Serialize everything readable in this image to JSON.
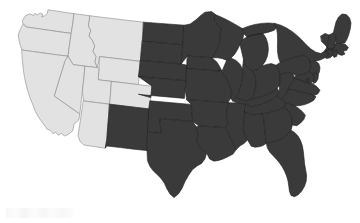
{
  "figure": {
    "title": "Map of the contiguous United States",
    "type": "choropleth-map",
    "background_color": "#ffffff"
  },
  "style": {
    "light_fill": "#e2e2e2",
    "dark_fill": "#3a3a3a",
    "light_border": "#8a8a8a",
    "dark_border": "#1f1f1f",
    "border_width": 0.6
  },
  "legend": {
    "visible": false,
    "categories": [
      {
        "key": "light",
        "label": "Western group",
        "color": "#e2e2e2"
      },
      {
        "key": "dark",
        "label": "Remaining states",
        "color": "#3a3a3a"
      }
    ]
  },
  "map_data": {
    "type": "choropleth",
    "region": "contiguous-united-states",
    "projection": "albers-usa",
    "group_counts": {
      "light": 10,
      "dark": 39
    },
    "light_states": [
      "WA",
      "OR",
      "ID",
      "MT",
      "WY",
      "NV",
      "UT",
      "CO",
      "CA",
      "AZ"
    ],
    "dark_states": [
      "ND",
      "SD",
      "NE",
      "KS",
      "OK",
      "TX",
      "NM",
      "MN",
      "IA",
      "MO",
      "AR",
      "LA",
      "WI",
      "IL",
      "MS",
      "MI",
      "IN",
      "KY",
      "TN",
      "AL",
      "OH",
      "WV",
      "GA",
      "FL",
      "SC",
      "NC",
      "VA",
      "PA",
      "NY",
      "MD",
      "DE",
      "NJ",
      "CT",
      "RI",
      "MA",
      "VT",
      "NH",
      "ME",
      "DC"
    ],
    "states": [
      {
        "code": "WA",
        "name": "Washington",
        "group": "light",
        "path": "M22.5 20.3 L25.8 15.2 L30.4 13.9 L33.6 15.6 L35.0 13.2 L36.8 15.1 L40.2 13.0 L43.0 14.4 L41.6 16.8 L44.5 15.9 L47.2 13.6 L48.0 9.8 L52.0 10.4 L58.8 11.4 L66.4 12.6 L74.2 13.7 L72.6 24.6 L71.2 33.4 L60.0 31.9 L48.6 30.2 L37.4 28.6 L26.2 27.0 L23.4 24.0 Z"
      },
      {
        "code": "OR",
        "name": "Oregon",
        "group": "light",
        "path": "M23.4 24.0 L26.2 27.0 L37.4 28.6 L48.6 30.2 L60.0 31.9 L71.2 33.4 L69.4 45.6 L68.0 56.2 L56.6 54.8 L45.0 53.2 L33.4 51.6 L22.0 50.0 L19.6 43.2 L18.2 35.0 L20.4 29.2 Z"
      },
      {
        "code": "ID",
        "name": "Idaho",
        "group": "light",
        "path": "M74.2 13.7 L82.0 14.7 L90.2 15.8 L88.6 26.0 L90.8 30.4 L89.0 36.0 L92.4 40.2 L94.8 46.0 L93.0 51.4 L96.2 56.4 L95.0 62.0 L97.4 67.6 L85.2 66.2 L73.0 64.6 L68.0 56.2 L69.4 45.6 L71.2 33.4 L72.6 24.6 Z"
      },
      {
        "code": "MT",
        "name": "Montana",
        "group": "light",
        "path": "M90.2 15.8 L103.0 17.4 L116.4 19.0 L130.0 20.6 L143.6 22.2 L142.4 36.6 L141.2 51.0 L140.4 61.4 L127.0 59.8 L113.4 58.2 L99.8 56.6 L97.4 67.6 L95.0 62.0 L96.2 56.4 L93.0 51.4 L94.8 46.0 L92.4 40.2 L89.0 36.0 L90.8 30.4 L88.6 26.0 Z"
      },
      {
        "code": "WY",
        "name": "Wyoming",
        "group": "light",
        "path": "M99.8 56.6 L113.4 58.2 L127.0 59.8 L140.4 61.4 L139.4 73.0 L138.4 84.6 L125.0 83.0 L111.6 81.4 L98.2 79.8 L99.0 68.2 Z"
      },
      {
        "code": "NV",
        "name": "Nevada",
        "group": "light",
        "path": "M68.0 56.2 L73.0 64.6 L85.2 66.2 L83.8 78.6 L82.4 91.0 L81.0 103.4 L79.8 114.0 L70.0 107.2 L62.0 101.6 L54.2 96.0 L58.4 82.0 L62.0 70.4 L64.8 61.2 Z"
      },
      {
        "code": "UT",
        "name": "Utah",
        "group": "light",
        "path": "M85.2 66.2 L97.4 67.6 L99.0 68.2 L98.2 79.8 L111.6 81.4 L110.6 92.8 L109.6 104.2 L96.6 102.6 L83.6 101.0 L82.4 91.0 L83.8 78.6 Z"
      },
      {
        "code": "CO",
        "name": "Colorado",
        "group": "light",
        "path": "M111.6 81.4 L125.0 83.0 L138.4 84.6 L151.8 86.2 L150.8 97.6 L149.8 109.0 L136.4 107.4 L123.0 105.8 L109.6 104.2 L110.6 92.8 Z"
      },
      {
        "code": "CA",
        "name": "California",
        "group": "light",
        "path": "M22.0 50.0 L33.4 51.6 L45.0 53.2 L56.6 54.8 L68.0 56.2 L64.8 61.2 L62.0 70.4 L58.4 82.0 L54.2 96.0 L62.0 101.6 L70.0 107.2 L79.8 114.0 L78.8 120.0 L74.0 124.2 L72.8 130.6 L68.4 134.4 L64.6 136.0 L61.0 133.2 L58.8 135.4 L55.2 132.0 L53.0 133.8 L50.4 130.4 L47.0 129.0 L44.8 125.8 L42.0 122.0 L38.6 117.2 L35.4 111.6 L33.0 105.0 L30.2 98.4 L27.8 91.0 L25.8 83.4 L24.2 75.6 L23.0 67.2 L22.2 58.6 Z"
      },
      {
        "code": "AZ",
        "name": "Arizona",
        "group": "light",
        "path": "M83.6 101.0 L96.6 102.6 L109.6 104.2 L108.6 115.8 L107.6 127.4 L106.8 139.0 L105.2 148.2 L93.0 146.4 L84.0 145.0 L80.2 141.6 L78.0 135.8 L79.2 128.0 L80.6 119.0 L81.8 110.4 Z"
      },
      {
        "code": "NM",
        "name": "New Mexico",
        "group": "dark",
        "path": "M109.6 104.2 L123.0 105.8 L136.4 107.4 L149.8 109.0 L148.8 120.6 L147.8 132.2 L146.8 143.8 L147.0 150.6 L133.8 149.2 L120.4 147.6 L107.0 146.0 L105.2 148.2 L106.8 139.0 L107.6 127.4 L108.6 115.8 Z"
      },
      {
        "code": "ND",
        "name": "North Dakota",
        "group": "dark",
        "path": "M143.6 22.2 L157.2 23.2 L170.8 24.2 L184.4 25.2 L183.6 35.0 L182.8 44.8 L169.4 43.6 L156.0 42.4 L142.4 41.2 L143.0 31.6 Z"
      },
      {
        "code": "SD",
        "name": "South Dakota",
        "group": "dark",
        "path": "M142.4 41.2 L156.0 42.4 L169.4 43.6 L182.8 44.8 L182.0 54.4 L181.2 64.0 L167.6 62.8 L154.0 61.6 L140.4 60.4 L141.2 51.0 Z"
      },
      {
        "code": "NE",
        "name": "Nebraska",
        "group": "dark",
        "path": "M140.4 60.4 L154.0 61.6 L167.6 62.8 L181.2 64.0 L187.4 65.2 L186.8 72.0 L186.0 80.8 L172.2 79.6 L158.4 78.4 L144.8 77.2 L138.4 76.4 L139.4 68.4 Z"
      },
      {
        "code": "KS",
        "name": "Kansas",
        "group": "dark",
        "path": "M138.4 76.4 L144.8 77.2 L158.4 78.4 L172.2 79.6 L186.0 80.8 L185.2 89.6 L184.4 98.4 L170.6 97.2 L156.8 96.0 L143.0 94.8 L138.4 94.2 L150.8 97.6 L151.8 86.2 Z"
      },
      {
        "code": "OK",
        "name": "Oklahoma",
        "group": "dark",
        "path": "M147.8 132.2 L161.2 133.4 L160.4 126.0 L159.8 118.6 L173.2 119.8 L186.6 121.0 L192.8 121.6 L192.0 113.0 L191.2 104.4 L177.4 103.2 L163.6 102.0 L149.8 100.8 L148.8 108.4 Z"
      },
      {
        "code": "TX",
        "name": "Texas",
        "group": "dark",
        "path": "M147.0 150.6 L146.8 143.8 L147.8 132.2 L161.2 133.4 L160.4 126.0 L159.8 118.6 L173.2 119.8 L186.6 121.0 L192.8 121.6 L196.4 127.0 L198.0 134.0 L196.6 141.0 L199.4 146.4 L202.8 150.2 L206.6 153.0 L205.0 158.8 L201.6 163.4 L197.0 166.0 L192.4 169.8 L188.6 175.2 L185.0 181.6 L182.0 188.4 L178.4 194.0 L174.0 197.6 L170.2 194.2 L167.0 189.0 L164.4 183.2 L161.0 178.4 L157.2 174.6 L153.4 171.0 L150.0 166.6 L147.6 161.0 Z"
      },
      {
        "code": "MN",
        "name": "Minnesota",
        "group": "dark",
        "path": "M184.4 25.2 L190.2 24.0 L196.0 19.8 L200.8 15.4 L205.0 12.2 L211.6 11.6 L215.8 14.8 L214.4 20.4 L217.6 25.0 L221.4 28.2 L219.8 33.8 L220.6 40.0 L218.2 46.8 L215.4 52.4 L212.0 57.8 L198.6 56.8 L187.4 56.0 L181.2 64.0 L182.0 54.4 L182.8 44.8 L183.6 35.0 Z"
      },
      {
        "code": "IA",
        "name": "Iowa",
        "group": "dark",
        "path": "M187.4 56.0 L198.6 56.8 L212.0 57.8 L216.8 62.0 L219.6 66.4 L222.0 71.2 L208.4 70.2 L194.8 69.2 L186.8 68.4 L186.8 62.0 Z"
      },
      {
        "code": "MO",
        "name": "Missouri",
        "group": "dark",
        "path": "M186.8 68.4 L194.8 69.2 L208.4 70.2 L222.0 71.2 L225.2 76.0 L227.8 81.4 L230.0 87.0 L232.4 92.6 L230.6 98.2 L228.0 102.6 L214.2 101.6 L200.4 100.6 L186.6 99.6 L185.2 89.6 L186.0 80.8 Z"
      },
      {
        "code": "AR",
        "name": "Arkansas",
        "group": "dark",
        "path": "M186.6 99.6 L200.4 100.6 L214.2 101.6 L228.0 102.6 L227.2 110.2 L226.4 117.8 L228.4 123.0 L226.0 127.8 L212.4 126.8 L198.8 125.8 L192.8 121.6 L192.0 113.0 L191.2 104.4 Z"
      },
      {
        "code": "LA",
        "name": "Louisiana",
        "group": "dark",
        "path": "M198.8 125.8 L212.4 126.8 L226.0 127.8 L228.8 133.2 L231.0 139.0 L233.6 144.4 L236.2 149.6 L233.0 154.0 L228.4 156.6 L223.6 158.8 L218.8 160.4 L214.0 161.2 L209.6 159.0 L206.6 153.0 L202.8 150.2 L199.4 146.4 L196.6 141.0 L198.0 134.0 L196.4 127.0 Z"
      },
      {
        "code": "WI",
        "name": "Wisconsin",
        "group": "dark",
        "path": "M215.8 14.8 L221.0 17.0 L226.4 19.6 L231.8 22.4 L237.0 25.4 L242.4 28.6 L244.0 33.8 L242.6 39.4 L240.0 44.6 L237.4 49.8 L234.6 54.4 L231.0 58.0 L226.6 60.2 L222.0 58.6 L217.6 57.8 L212.0 57.8 L215.4 52.4 L218.2 46.8 L220.6 40.0 L219.8 33.8 L221.4 28.2 L217.6 25.0 L214.4 20.4 Z"
      },
      {
        "code": "IL",
        "name": "Illinois",
        "group": "dark",
        "path": "M222.0 71.2 L226.6 60.2 L231.0 58.0 L236.0 60.4 L239.8 64.0 L242.4 68.8 L243.0 74.6 L242.0 80.8 L240.6 87.0 L238.6 92.8 L236.0 97.8 L232.8 101.0 L230.6 98.2 L232.4 92.6 L230.0 87.0 L227.8 81.4 L225.2 76.0 Z"
      },
      {
        "code": "MS",
        "name": "Mississippi",
        "group": "dark",
        "path": "M226.0 127.8 L228.4 123.0 L226.4 117.8 L227.2 110.2 L228.0 102.6 L237.0 103.2 L246.0 103.8 L245.0 112.0 L244.2 120.2 L243.4 128.4 L244.8 134.8 L247.6 140.0 L244.0 143.4 L240.2 145.8 L236.2 149.6 L233.6 144.4 L231.0 139.0 L228.8 133.2 Z"
      },
      {
        "code": "MI",
        "name": "Michigan",
        "group": "dark",
        "path": "M242.4 28.6 L248.6 26.2 L255.0 24.4 L261.6 23.4 L268.2 23.0 L274.8 23.4 L277.4 27.2 L273.8 30.4 L268.6 32.2 L263.0 33.4 L257.4 34.2 L252.0 35.4 L247.0 37.0 L244.0 33.8 Z M252.0 35.4 L257.4 34.2 L263.0 33.4 L266.0 38.0 L267.8 43.6 L268.4 49.6 L267.6 55.6 L265.4 61.2 L262.0 66.0 L257.8 69.4 L253.0 71.0 L248.4 69.0 L245.2 65.0 L243.6 60.0 L240.0 44.6 L242.6 39.4 L247.0 37.0 Z"
      },
      {
        "code": "IN",
        "name": "Indiana",
        "group": "dark",
        "path": "M243.6 60.0 L245.2 65.0 L248.4 69.0 L253.0 71.0 L255.4 76.4 L256.2 82.6 L255.4 88.8 L253.8 94.6 L251.0 99.2 L247.0 101.0 L243.0 100.2 L236.0 97.8 L238.6 92.8 L240.6 87.0 L242.0 80.8 L243.0 74.6 L242.4 68.8 Z"
      },
      {
        "code": "KY",
        "name": "Kentucky",
        "group": "dark",
        "path": "M232.8 101.0 L236.0 97.8 L243.0 100.2 L247.0 101.0 L251.0 99.2 L256.6 97.6 L262.4 96.0 L268.2 94.0 L273.8 91.4 L277.0 88.0 L279.4 91.6 L277.0 96.0 L272.8 99.4 L267.8 102.0 L262.4 104.2 L256.8 105.8 L251.0 107.0 L246.0 103.8 L237.0 103.2 Z"
      },
      {
        "code": "TN",
        "name": "Tennessee",
        "group": "dark",
        "path": "M246.0 103.8 L251.0 107.0 L256.8 105.8 L262.4 104.2 L267.8 102.0 L272.8 99.4 L277.0 96.0 L281.8 98.8 L285.4 102.4 L284.2 107.0 L279.8 109.6 L274.4 111.4 L268.8 112.8 L263.2 113.8 L257.6 114.4 L252.0 114.8 L245.0 112.0 Z"
      },
      {
        "code": "AL",
        "name": "Alabama",
        "group": "dark",
        "path": "M245.0 112.0 L252.0 114.8 L257.6 114.4 L263.2 113.8 L264.0 121.4 L264.8 129.0 L265.6 136.6 L266.4 143.2 L263.0 145.6 L259.0 146.8 L255.0 147.2 L251.2 146.2 L247.6 140.0 L244.8 134.8 L243.4 128.4 L244.2 120.2 Z"
      },
      {
        "code": "OH",
        "name": "Ohio",
        "group": "dark",
        "path": "M253.0 71.0 L257.8 69.4 L262.0 66.0 L266.6 64.4 L271.4 63.6 L276.0 65.2 L278.6 69.4 L279.8 74.8 L280.0 80.4 L279.4 86.0 L277.0 88.0 L273.8 91.4 L268.2 94.0 L262.4 96.0 L256.6 97.6 L251.0 99.2 L253.8 94.6 L255.4 88.8 L256.2 82.6 L255.4 76.4 Z"
      },
      {
        "code": "WV",
        "name": "West Virginia",
        "group": "dark",
        "path": "M279.4 86.0 L280.0 80.4 L279.8 74.8 L284.0 73.0 L288.4 72.0 L292.6 73.6 L294.8 77.4 L293.4 81.6 L290.4 84.8 L288.2 88.6 L286.8 93.0 L284.4 96.4 L281.8 98.8 L277.0 96.0 L279.4 91.6 Z"
      },
      {
        "code": "GA",
        "name": "Georgia",
        "group": "dark",
        "path": "M263.2 113.8 L268.8 112.8 L274.4 111.4 L279.8 109.6 L284.2 107.0 L288.0 110.0 L290.6 114.4 L292.0 119.6 L292.4 125.0 L291.0 130.2 L288.0 134.4 L284.0 137.4 L279.6 139.6 L275.0 141.4 L270.4 142.6 L266.4 143.2 L265.6 136.6 L264.8 129.0 L264.0 121.4 Z"
      },
      {
        "code": "FL",
        "name": "Florida",
        "group": "dark",
        "path": "M266.4 143.2 L270.4 142.6 L275.0 141.4 L279.6 139.6 L284.0 137.4 L288.0 134.4 L291.0 130.2 L294.6 132.4 L298.0 136.0 L300.6 140.6 L302.4 146.0 L303.4 151.8 L304.0 157.8 L304.6 163.8 L305.6 169.6 L306.6 175.4 L306.2 181.2 L304.4 186.6 L301.6 191.2 L298.2 194.8 L294.4 196.8 L291.0 195.4 L289.4 191.2 L288.8 186.2 L288.0 181.0 L286.6 176.0 L284.6 171.2 L282.2 166.8 L279.4 162.8 L276.4 159.2 L273.2 155.8 L270.0 152.4 L267.6 148.4 Z"
      },
      {
        "code": "SC",
        "name": "South Carolina",
        "group": "dark",
        "path": "M284.2 107.0 L285.4 102.4 L289.8 103.6 L294.2 105.6 L298.4 108.2 L302.2 111.4 L305.4 115.2 L303.8 119.6 L300.6 123.0 L296.8 125.8 L292.4 125.0 L292.0 119.6 L290.6 114.4 L288.0 110.0 Z"
      },
      {
        "code": "NC",
        "name": "North Carolina",
        "group": "dark",
        "path": "M285.4 102.4 L281.8 98.8 L284.4 96.4 L286.8 93.0 L288.2 88.6 L292.8 89.8 L297.6 91.0 L302.4 92.2 L307.2 93.4 L312.0 94.6 L316.0 96.8 L313.6 100.4 L309.4 102.8 L304.8 104.6 L300.0 105.6 L295.0 106.0 L289.8 103.6 Z"
      },
      {
        "code": "VA",
        "name": "Virginia",
        "group": "dark",
        "path": "M288.2 88.6 L290.4 84.8 L293.4 81.6 L294.8 77.4 L299.6 78.4 L304.4 79.8 L309.0 81.6 L313.2 84.0 L317.0 86.8 L320.0 90.2 L318.0 93.8 L314.2 95.6 L312.0 94.6 L307.2 93.4 L302.4 92.2 L297.6 91.0 L292.8 89.8 Z"
      },
      {
        "code": "PA",
        "name": "Pennsylvania",
        "group": "dark",
        "path": "M276.0 65.2 L280.2 62.4 L284.8 60.2 L289.6 58.6 L294.4 57.2 L299.2 56.0 L304.0 55.0 L308.2 57.8 L310.6 62.0 L311.0 67.0 L309.2 71.4 L305.4 73.8 L300.8 75.0 L296.0 75.8 L292.6 73.6 L288.4 72.0 L284.0 73.0 L279.8 74.8 L278.6 69.4 Z"
      },
      {
        "code": "NY",
        "name": "New York",
        "group": "dark",
        "path": "M274.8 23.4 L280.8 25.2 L286.6 28.0 L292.0 31.4 L297.0 35.4 L301.6 39.8 L306.0 44.4 L310.6 48.8 L315.6 52.0 L320.8 53.6 L324.6 51.0 L327.0 47.0 L330.2 49.4 L328.8 54.2 L325.2 57.6 L320.6 59.8 L315.6 61.2 L310.4 62.0 L308.2 57.8 L304.0 55.0 L299.2 56.0 L294.4 57.2 L289.6 58.6 L284.8 60.2 L280.2 62.4 L278.4 57.6 L277.6 52.0 L277.4 46.0 L277.6 40.0 L277.4 34.0 L276.6 28.4 Z"
      },
      {
        "code": "MD",
        "name": "Maryland",
        "group": "dark",
        "path": "M294.8 77.4 L296.0 75.8 L300.8 75.0 L305.4 73.8 L309.2 71.4 L312.6 73.8 L314.4 77.8 L312.8 81.6 L309.4 83.4 L305.6 82.2 L301.4 80.6 L297.2 79.2 Z"
      },
      {
        "code": "DE",
        "name": "Delaware",
        "group": "dark",
        "path": "M312.6 73.8 L315.8 72.2 L318.4 74.8 L318.0 79.0 L316.0 82.2 L313.6 83.4 L312.8 81.6 L314.4 77.8 Z"
      },
      {
        "code": "NJ",
        "name": "New Jersey",
        "group": "dark",
        "path": "M310.4 62.0 L315.6 61.2 L318.8 63.6 L320.0 67.8 L319.4 72.0 L317.6 75.4 L315.8 72.2 L312.6 73.8 L309.2 71.4 L311.0 67.0 Z"
      },
      {
        "code": "CT",
        "name": "Connecticut",
        "group": "dark",
        "path": "M324.6 51.0 L329.8 49.2 L333.6 50.8 L333.0 55.2 L330.0 57.8 L326.4 58.6 L325.2 57.6 L328.8 54.2 Z"
      },
      {
        "code": "RI",
        "name": "Rhode Island",
        "group": "dark",
        "path": "M333.6 50.8 L336.4 50.0 L337.8 52.8 L336.6 56.4 L334.0 57.4 L333.0 55.2 Z"
      },
      {
        "code": "MA",
        "name": "Massachusetts",
        "group": "dark",
        "path": "M327.0 47.0 L331.6 44.8 L336.4 43.6 L341.2 43.2 L345.6 44.6 L348.4 47.6 L346.4 50.6 L343.2 51.0 L345.0 54.0 L341.8 55.4 L338.4 54.2 L336.4 50.0 L333.6 50.8 L329.8 49.2 Z"
      },
      {
        "code": "VT",
        "name": "Vermont",
        "group": "dark",
        "path": "M320.8 36.0 L325.0 33.4 L329.0 35.0 L328.6 39.6 L327.8 44.2 L327.0 47.0 L324.6 44.6 L321.6 41.4 Z"
      },
      {
        "code": "NH",
        "name": "New Hampshire",
        "group": "dark",
        "path": "M329.0 35.0 L333.4 32.8 L336.2 36.4 L335.6 41.0 L334.6 45.6 L333.4 49.0 L329.8 49.2 L327.0 47.0 L327.8 44.2 L328.6 39.6 Z"
      },
      {
        "code": "ME",
        "name": "Maine",
        "group": "dark",
        "path": "M333.4 32.8 L334.6 27.4 L336.0 22.0 L338.4 17.2 L342.0 14.0 L346.4 14.6 L349.6 18.0 L351.0 23.0 L350.4 28.4 L349.0 33.8 L347.2 38.8 L344.8 43.0 L341.2 43.2 L336.4 43.6 L335.6 41.0 L336.2 36.4 Z"
      },
      {
        "code": "DC",
        "name": "District of Columbia",
        "group": "dark",
        "path": "M306.6 79.0 L308.6 78.2 L309.4 80.2 L307.6 81.2 Z"
      }
    ]
  }
}
